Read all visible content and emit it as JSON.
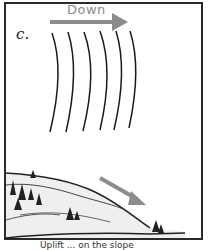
{
  "panel": {
    "label": "c.",
    "arrow_label": "Down",
    "caption": "Uplift ... on the slope",
    "colors": {
      "arrow": "#8c8c8c",
      "lines": "#1a1a1a",
      "border": "#2a2a2a"
    }
  }
}
